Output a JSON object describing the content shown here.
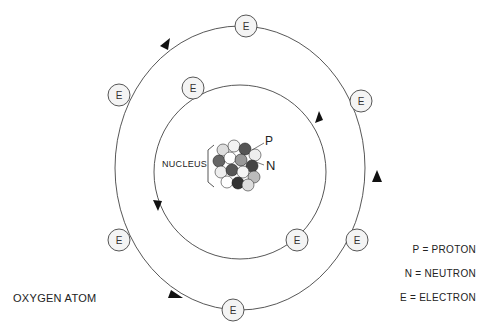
{
  "title": "OXYGEN ATOM",
  "nucleus": {
    "label": "NUCLEUS",
    "proton_marker": "P",
    "neutron_marker": "N"
  },
  "electron_label": "E",
  "legend": [
    {
      "label": "P = PROTON"
    },
    {
      "label": "N = NEUTRON"
    },
    {
      "label": "E = ELECTRON"
    }
  ],
  "orbits": {
    "inner": {
      "electrons": 2
    },
    "outer": {
      "electrons": 6
    }
  },
  "colors": {
    "line": "#444444",
    "electron_fill": "#f4f4f4"
  }
}
